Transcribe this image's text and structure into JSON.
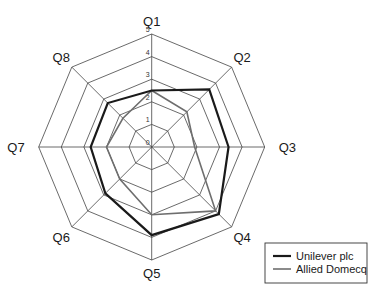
{
  "chart_data": {
    "type": "radar",
    "title": "",
    "categories": [
      "Q1",
      "Q2",
      "Q3",
      "Q4",
      "Q5",
      "Q6",
      "Q7",
      "Q8"
    ],
    "rlim": [
      0,
      5
    ],
    "ticks": [
      "0",
      "1",
      "2",
      "3",
      "4",
      "5"
    ],
    "grid": true,
    "legend_position": "bottom-right",
    "series": [
      {
        "name": "Unilever plc",
        "color": "#1a1a1a",
        "values": [
          2.5,
          3.6,
          3.4,
          4.2,
          3.9,
          2.9,
          2.7,
          2.75
        ]
      },
      {
        "name": "Allied Domecq",
        "color": "#6e6e6e",
        "values": [
          2.5,
          2.2,
          1.9,
          4.0,
          3.0,
          2.0,
          2.0,
          1.8
        ]
      }
    ]
  }
}
